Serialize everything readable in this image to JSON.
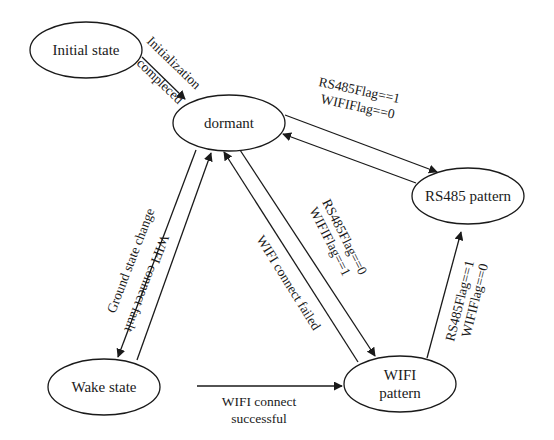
{
  "diagram": {
    "type": "state-transition",
    "colors": {
      "stroke": "#1a1a1a",
      "background": "#ffffff"
    },
    "nodes": [
      {
        "id": "initial",
        "label": "Initial state"
      },
      {
        "id": "dormant",
        "label": "dormant"
      },
      {
        "id": "rs485",
        "label": "RS485 pattern"
      },
      {
        "id": "wake",
        "label": "Wake state"
      },
      {
        "id": "wifi",
        "label_line1": "WIFI",
        "label_line2": "pattern"
      }
    ],
    "edges": [
      {
        "id": "initial-to-dormant",
        "from": "initial",
        "to": "dormant",
        "label_line1": "Initialization",
        "label_line2": "compleced"
      },
      {
        "id": "dormant-to-rs485",
        "from": "dormant",
        "to": "rs485",
        "label_line1": "RS485Flag==1",
        "label_line2": "WIFIFlag==0"
      },
      {
        "id": "rs485-to-dormant",
        "from": "rs485",
        "to": "dormant",
        "label": ""
      },
      {
        "id": "dormant-to-wake",
        "from": "dormant",
        "to": "wake",
        "label": "Ground state change"
      },
      {
        "id": "wake-to-dormant",
        "from": "wake",
        "to": "dormant",
        "label": "WIFI connect fault"
      },
      {
        "id": "wifi-to-dormant",
        "from": "wifi",
        "to": "dormant",
        "label": "WIFI connect failed"
      },
      {
        "id": "dormant-to-wifi",
        "from": "dormant",
        "to": "wifi",
        "label_line1": "RS485Flag==0",
        "label_line2": "WIFIFlag==1"
      },
      {
        "id": "wake-to-wifi",
        "from": "wake",
        "to": "wifi",
        "label_line1": "WIFI connect",
        "label_line2": "successful"
      },
      {
        "id": "wifi-to-rs485",
        "from": "wifi",
        "to": "rs485",
        "label_line1": "RS485Flag==1",
        "label_line2": "WIFIFlag==0"
      }
    ]
  }
}
